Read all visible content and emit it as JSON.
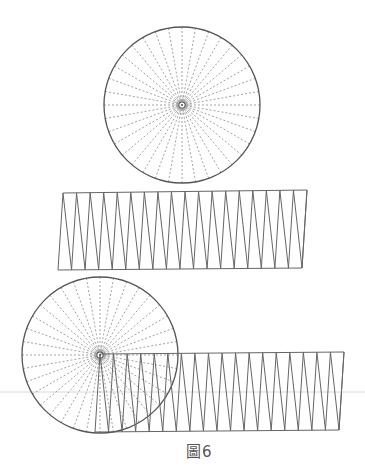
{
  "figure": {
    "caption": "圖6",
    "colors": {
      "outline": "#555555",
      "radial": "#999999",
      "zigzag": "#666666",
      "artifact": "#d8d8d8"
    },
    "sectors": 36,
    "teeth": 18,
    "top_circle": {
      "cx": 182,
      "cy": 105,
      "r": 78
    },
    "middle_strip": {
      "top_left": [
        63,
        193
      ],
      "top_right": [
        307,
        190
      ],
      "bottom_left": [
        58,
        270
      ],
      "bottom_right": [
        302,
        268
      ]
    },
    "bottom_circle": {
      "cx": 100,
      "cy": 355,
      "r": 78
    },
    "bottom_strip": {
      "top_left": [
        100,
        354
      ],
      "top_right": [
        344,
        352
      ],
      "bottom_left": [
        95,
        432
      ],
      "bottom_right": [
        339,
        430
      ]
    },
    "artifact_line_y": 392
  }
}
